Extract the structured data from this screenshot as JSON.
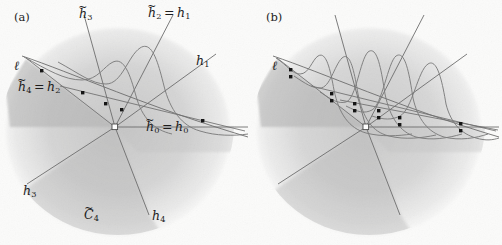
{
  "figure": {
    "width": 502,
    "height": 245,
    "background_color": "#fbfbfa",
    "ink_color": "#5a5a5a",
    "dot_color": "#101010",
    "shade_dark_color": "#bcbcbc",
    "shade_mid_color": "#d0d0d0",
    "shade_light_color": "#e2e2e2"
  },
  "panels": [
    {
      "id": "a",
      "tag": "(a)",
      "tag_x": 14,
      "tag_y": 17,
      "labels": [
        {
          "name": "label-ell",
          "text": "ℓ",
          "tilde": false,
          "sub": "",
          "eq_rhs": "",
          "eq_rhs_tilde": false,
          "eq_rhs_sub": "",
          "x": 14,
          "y": 63
        },
        {
          "name": "label-h3-tilde",
          "text": "h",
          "tilde": true,
          "sub": "3",
          "eq_rhs": "",
          "eq_rhs_tilde": false,
          "eq_rhs_sub": "",
          "x": 79,
          "y": 11
        },
        {
          "name": "label-h2-tilde-eq-h1",
          "text": "h",
          "tilde": true,
          "sub": "2",
          "eq_rhs": "h",
          "eq_rhs_tilde": false,
          "eq_rhs_sub": "1",
          "x": 148,
          "y": 10
        },
        {
          "name": "label-h1",
          "text": "h",
          "tilde": false,
          "sub": "1",
          "eq_rhs": "",
          "eq_rhs_tilde": false,
          "eq_rhs_sub": "",
          "x": 196,
          "y": 58
        },
        {
          "name": "label-h4-tilde-eq-h2",
          "text": "h",
          "tilde": true,
          "sub": "4",
          "eq_rhs": "h",
          "eq_rhs_tilde": false,
          "eq_rhs_sub": "2",
          "x": 18,
          "y": 84
        },
        {
          "name": "label-h0-tilde-eq-h0",
          "text": "h",
          "tilde": true,
          "sub": "0",
          "eq_rhs": "h",
          "eq_rhs_tilde": false,
          "eq_rhs_sub": "0",
          "x": 146,
          "y": 124
        },
        {
          "name": "label-h3",
          "text": "h",
          "tilde": false,
          "sub": "3",
          "eq_rhs": "",
          "eq_rhs_tilde": false,
          "eq_rhs_sub": "",
          "x": 23,
          "y": 188
        },
        {
          "name": "label-c4-tilde",
          "text": "C",
          "tilde": true,
          "sub": "4",
          "eq_rhs": "",
          "eq_rhs_tilde": false,
          "eq_rhs_sub": "",
          "x": 84,
          "y": 212
        },
        {
          "name": "label-h4",
          "text": "h",
          "tilde": false,
          "sub": "4",
          "eq_rhs": "",
          "eq_rhs_tilde": false,
          "eq_rhs_sub": "",
          "x": 152,
          "y": 213
        }
      ],
      "vertex": {
        "x": 115,
        "y": 127
      },
      "rays": [
        {
          "name": "ray-h0-right",
          "x2": 245,
          "y2": 127
        },
        {
          "name": "ray-h1-up-right",
          "x2": 215,
          "y2": 55
        },
        {
          "name": "ray-h2-up-right",
          "x2": 172,
          "y2": 16
        },
        {
          "name": "ray-h3-up-left",
          "x2": 84,
          "y2": 16
        },
        {
          "name": "ray-h3-down-left",
          "x2": 28,
          "y2": 183
        },
        {
          "name": "ray-h4-down",
          "x2": 148,
          "y2": 214
        }
      ],
      "points": [
        {
          "x": 42,
          "y": 71
        },
        {
          "x": 83,
          "y": 93
        },
        {
          "x": 106,
          "y": 104
        },
        {
          "x": 122,
          "y": 110
        },
        {
          "x": 203,
          "y": 121
        }
      ],
      "curves": [
        {
          "name": "curve-bump-1",
          "peak_x": 138,
          "peak_y": 48
        },
        {
          "name": "curve-bump-2",
          "peak_x": 108,
          "peak_y": 66
        }
      ],
      "secant_line": {
        "x1": 26,
        "y1": 58,
        "x2": 245,
        "y2": 135
      },
      "cone_shade": {
        "apex_x": 115,
        "apex_y": 127
      }
    },
    {
      "id": "b",
      "tag": "(b)",
      "tag_x": 266,
      "tag_y": 17,
      "labels": [
        {
          "name": "label-ell",
          "text": "ℓ",
          "tilde": false,
          "sub": "",
          "eq_rhs": "",
          "eq_rhs_tilde": false,
          "eq_rhs_sub": "",
          "x": 272,
          "y": 63
        }
      ],
      "vertex": {
        "x": 366,
        "y": 127
      },
      "rays": [
        {
          "name": "ray-h0-right",
          "x2": 496,
          "y2": 127
        },
        {
          "name": "ray-up-right-1",
          "x2": 466,
          "y2": 55
        },
        {
          "name": "ray-up-right-2",
          "x2": 423,
          "y2": 16
        },
        {
          "name": "ray-up-left",
          "x2": 335,
          "y2": 16
        },
        {
          "name": "ray-down-left",
          "x2": 279,
          "y2": 183
        },
        {
          "name": "ray-down",
          "x2": 399,
          "y2": 214
        }
      ],
      "point_pairs": [
        {
          "x": 291,
          "y": 72
        },
        {
          "x": 332,
          "y": 96
        },
        {
          "x": 355,
          "y": 106
        },
        {
          "x": 379,
          "y": 113
        },
        {
          "x": 400,
          "y": 119
        },
        {
          "x": 461,
          "y": 126
        }
      ],
      "curves": [
        {
          "name": "curve-bump-1",
          "peak_x": 300,
          "peak_y": 72
        },
        {
          "name": "curve-bump-2",
          "peak_x": 330,
          "peak_y": 58
        },
        {
          "name": "curve-bump-3",
          "peak_x": 360,
          "peak_y": 52
        },
        {
          "name": "curve-bump-4",
          "peak_x": 392,
          "peak_y": 56
        },
        {
          "name": "curve-bump-5",
          "peak_x": 424,
          "peak_y": 64
        }
      ],
      "secant_line": {
        "x1": 277,
        "y1": 58,
        "x2": 496,
        "y2": 135
      },
      "cone_shade": {
        "apex_x": 366,
        "apex_y": 127
      }
    }
  ]
}
